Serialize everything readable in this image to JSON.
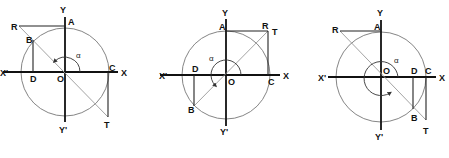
{
  "figure": {
    "panels": [
      {
        "id": "panel-1",
        "labels": {
          "Y": "Y",
          "Yp": "Y'",
          "X": "X",
          "Xp": "X'",
          "O": "O",
          "A": "A",
          "B": "B",
          "C": "C",
          "D": "D",
          "R": "R",
          "T": "T",
          "angle": "α"
        }
      },
      {
        "id": "panel-2",
        "labels": {
          "Y": "Y",
          "Yp": "Y'",
          "X": "X",
          "Xp": "X'",
          "O": "O",
          "A": "A",
          "B": "B",
          "C": "C",
          "D": "D",
          "R": "R",
          "T": "T",
          "angle": "α"
        }
      },
      {
        "id": "panel-3",
        "labels": {
          "Y": "Y",
          "Yp": "Y'",
          "X": "X",
          "Xp": "X'",
          "O": "O",
          "A": "A",
          "B": "B",
          "C": "C",
          "D": "D",
          "R": "R",
          "T": "T",
          "angle": "α"
        }
      }
    ]
  }
}
